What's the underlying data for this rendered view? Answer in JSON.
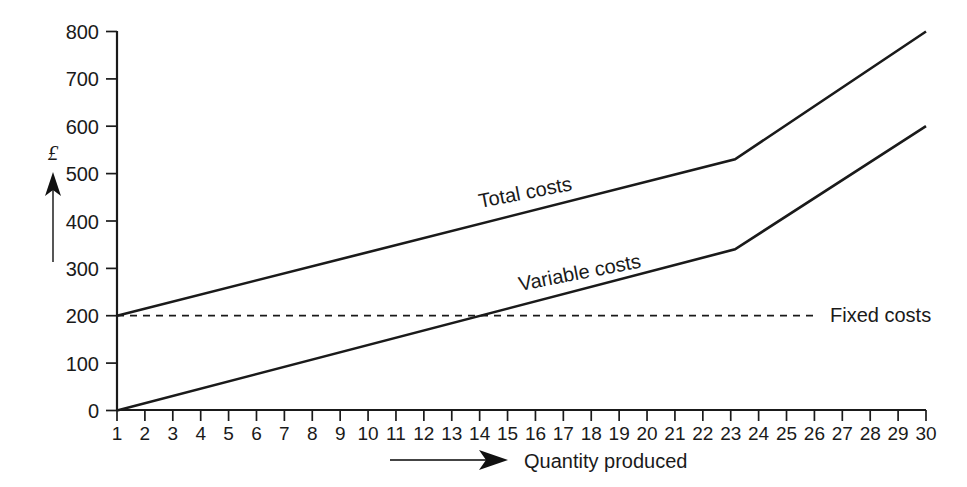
{
  "chart_data": {
    "type": "line",
    "title": "",
    "xlabel": "Quantity produced",
    "ylabel": "£",
    "xlim": [
      1,
      30
    ],
    "ylim": [
      0,
      800
    ],
    "grid": false,
    "legend_position": "inline-on-lines",
    "x_tick_labels": [
      "1",
      "2",
      "3",
      "4",
      "5",
      "6",
      "7",
      "8",
      "9",
      "10",
      "11",
      "12",
      "13",
      "14",
      "15",
      "16",
      "17",
      "18",
      "19",
      "20",
      "21",
      "22",
      "23",
      "24",
      "25",
      "26",
      "27",
      "28",
      "29",
      "30"
    ],
    "y_tick_labels": [
      "0",
      "100",
      "200",
      "300",
      "400",
      "500",
      "600",
      "700",
      "800"
    ],
    "y_ticks": [
      0,
      100,
      200,
      300,
      400,
      500,
      600,
      700,
      800
    ],
    "series": [
      {
        "name": "Total costs",
        "style": "solid",
        "x": [
          1,
          23,
          30
        ],
        "values": [
          200,
          530,
          800
        ]
      },
      {
        "name": "Variable costs",
        "style": "solid",
        "x": [
          1,
          23,
          30
        ],
        "values": [
          0,
          340,
          600
        ]
      },
      {
        "name": "Fixed costs",
        "style": "dashed",
        "x": [
          1,
          30
        ],
        "values": [
          200,
          200
        ]
      }
    ],
    "annotations": [
      {
        "name": "total-costs-label",
        "text": "Total costs",
        "x": 15,
        "y": 430,
        "rotation": -11
      },
      {
        "name": "variable-costs-label",
        "text": "Variable costs",
        "x": 16,
        "y": 255,
        "rotation": -11
      },
      {
        "name": "fixed-costs-label",
        "text": "Fixed costs",
        "x": 30.5,
        "y": 200,
        "rotation": 0
      }
    ]
  },
  "axes": {
    "y_axis_symbol": "£",
    "x_axis_title": "Quantity produced"
  },
  "labels": {
    "y": {
      "t0": "0",
      "t100": "100",
      "t200": "200",
      "t300": "300",
      "t400": "400",
      "t500": "500",
      "t600": "600",
      "t700": "700",
      "t800": "800"
    },
    "series": {
      "total": "Total costs",
      "variable": "Variable costs",
      "fixed": "Fixed costs"
    }
  }
}
